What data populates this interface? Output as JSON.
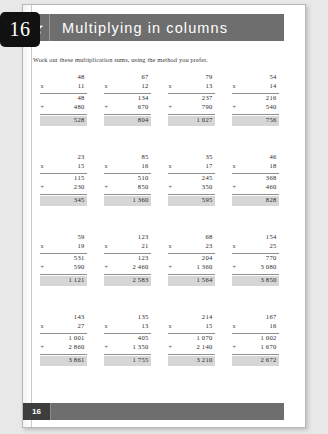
{
  "chapter_tab": {
    "number": "16"
  },
  "header": {
    "title": "Multiplying in columns",
    "star_icon": "star-icon",
    "band_color": "#6e6e6e"
  },
  "instruction": "Work out these multiplication sums, using the method you prefer.",
  "footer": {
    "page_number": "16"
  },
  "answer_box_color": "#d6d6d6",
  "problems": [
    {
      "multiplicand": "48",
      "operator": "x",
      "multiplier": "11",
      "partial1": "48",
      "plus": "+",
      "partial2": "480",
      "answer": "528"
    },
    {
      "multiplicand": "67",
      "operator": "x",
      "multiplier": "12",
      "partial1": "134",
      "plus": "+",
      "partial2": "670",
      "answer": "804"
    },
    {
      "multiplicand": "79",
      "operator": "x",
      "multiplier": "13",
      "partial1": "237",
      "plus": "+",
      "partial2": "790",
      "answer": "1 027"
    },
    {
      "multiplicand": "54",
      "operator": "x",
      "multiplier": "14",
      "partial1": "216",
      "plus": "+",
      "partial2": "540",
      "answer": "756"
    },
    {
      "multiplicand": "23",
      "operator": "x",
      "multiplier": "15",
      "partial1": "115",
      "plus": "+",
      "partial2": "230",
      "answer": "345"
    },
    {
      "multiplicand": "85",
      "operator": "x",
      "multiplier": "16",
      "partial1": "510",
      "plus": "+",
      "partial2": "850",
      "answer": "1 360"
    },
    {
      "multiplicand": "35",
      "operator": "x",
      "multiplier": "17",
      "partial1": "245",
      "plus": "+",
      "partial2": "350",
      "answer": "595"
    },
    {
      "multiplicand": "46",
      "operator": "x",
      "multiplier": "18",
      "partial1": "368",
      "plus": "+",
      "partial2": "460",
      "answer": "828"
    },
    {
      "multiplicand": "59",
      "operator": "x",
      "multiplier": "19",
      "partial1": "531",
      "plus": "+",
      "partial2": "590",
      "answer": "1 121"
    },
    {
      "multiplicand": "123",
      "operator": "x",
      "multiplier": "21",
      "partial1": "123",
      "plus": "+",
      "partial2": "2 460",
      "answer": "2 583"
    },
    {
      "multiplicand": "68",
      "operator": "x",
      "multiplier": "23",
      "partial1": "204",
      "plus": "+",
      "partial2": "1 360",
      "answer": "1 564"
    },
    {
      "multiplicand": "154",
      "operator": "x",
      "multiplier": "25",
      "partial1": "770",
      "plus": "+",
      "partial2": "3 080",
      "answer": "3 850"
    },
    {
      "multiplicand": "143",
      "operator": "x",
      "multiplier": "27",
      "partial1": "1 001",
      "plus": "+",
      "partial2": "2 860",
      "answer": "3 861"
    },
    {
      "multiplicand": "135",
      "operator": "x",
      "multiplier": "13",
      "partial1": "405",
      "plus": "+",
      "partial2": "1 350",
      "answer": "1 755"
    },
    {
      "multiplicand": "214",
      "operator": "x",
      "multiplier": "15",
      "partial1": "1 070",
      "plus": "+",
      "partial2": "2 140",
      "answer": "3 210"
    },
    {
      "multiplicand": "167",
      "operator": "x",
      "multiplier": "16",
      "partial1": "1 002",
      "plus": "+",
      "partial2": "1 670",
      "answer": "2 672"
    }
  ]
}
